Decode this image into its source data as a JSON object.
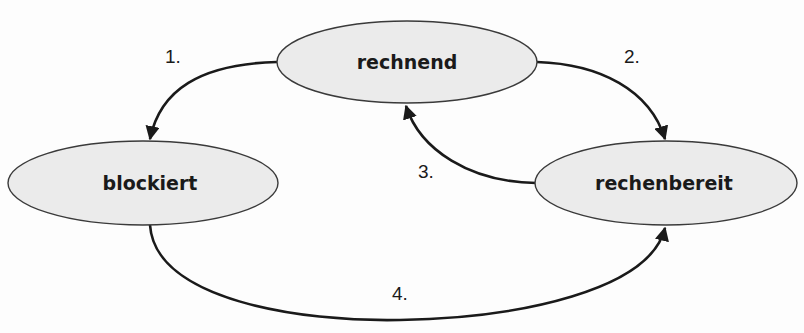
{
  "diagram": {
    "type": "state-diagram",
    "nodes": [
      {
        "id": "rechnend",
        "label": "rechnend"
      },
      {
        "id": "blockiert",
        "label": "blockiert"
      },
      {
        "id": "rechenbereit",
        "label": "rechenbereit"
      }
    ],
    "edges": [
      {
        "id": "e1",
        "label": "1.",
        "from": "rechnend",
        "to": "blockiert"
      },
      {
        "id": "e2",
        "label": "2.",
        "from": "rechnend",
        "to": "rechenbereit"
      },
      {
        "id": "e3",
        "label": "3.",
        "from": "rechenbereit",
        "to": "rechnend"
      },
      {
        "id": "e4",
        "label": "4.",
        "from": "blockiert",
        "to": "rechenbereit"
      }
    ],
    "colors": {
      "node_fill": "#ebebeb",
      "node_stroke": "#3a3a3a",
      "edge": "#1a1a1a",
      "text": "#1a1a1a"
    }
  }
}
